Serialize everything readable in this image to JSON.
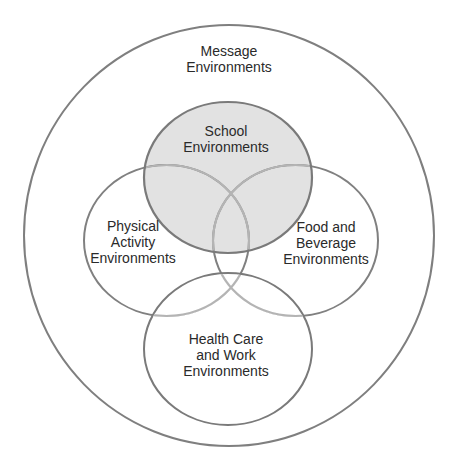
{
  "diagram": {
    "type": "nested-venn",
    "outer": {
      "label_lines": [
        "Message",
        "Environments"
      ],
      "stroke": "#7f7f7f"
    },
    "circles": [
      {
        "id": "school",
        "label_lines": [
          "School",
          "Environments"
        ],
        "fill": "#e2e2e2",
        "stroke": "#7a7a7a",
        "highlighted": true
      },
      {
        "id": "physical-activity",
        "label_lines": [
          "Physical",
          "Activity",
          "Environments"
        ],
        "fill": "none",
        "stroke": "#808080"
      },
      {
        "id": "food-beverage",
        "label_lines": [
          "Food and",
          "Beverage",
          "Environments"
        ],
        "fill": "none",
        "stroke": "#808080"
      },
      {
        "id": "health-care-work",
        "label_lines": [
          "Health Care",
          "and Work",
          "Environments"
        ],
        "fill": "none",
        "stroke": "#7a7a7a"
      }
    ],
    "inner_overlap_stroke": "#b4b4b4"
  }
}
